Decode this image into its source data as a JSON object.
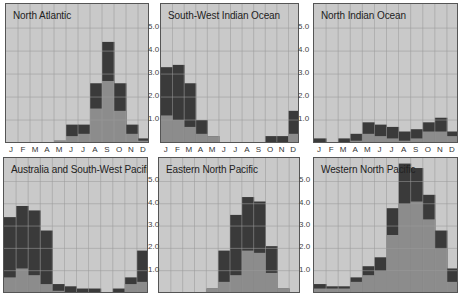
{
  "colors": {
    "background": "#c9c9c9",
    "grid": "#9c9c9c",
    "total": "#3a3a3a",
    "severe": "#8c8c8c",
    "border": "#555555"
  },
  "chart_data": [
    {
      "type": "bar",
      "title": "North Atlantic",
      "categories": [
        "J",
        "F",
        "M",
        "A",
        "M",
        "J",
        "J",
        "A",
        "S",
        "O",
        "N",
        "D"
      ],
      "series": [
        {
          "name": "total (dark)",
          "values": [
            0,
            0,
            0,
            0,
            0.1,
            0.8,
            0.8,
            2.6,
            4.4,
            2.6,
            0.8,
            0.2
          ]
        },
        {
          "name": "lower (mid-gray)",
          "values": [
            0,
            0,
            0,
            0,
            0.1,
            0.3,
            0.4,
            1.5,
            2.7,
            1.4,
            0.4,
            0.1
          ]
        }
      ],
      "yticks": [
        "1.0",
        "2.0",
        "3.0",
        "4.0",
        "5.0"
      ],
      "ylim": [
        0,
        6
      ],
      "grid": true
    },
    {
      "type": "bar",
      "title": "South-West Indian Ocean",
      "categories": [
        "J",
        "F",
        "M",
        "A",
        "M",
        "J",
        "J",
        "A",
        "S",
        "O",
        "N",
        "D"
      ],
      "series": [
        {
          "name": "total (dark)",
          "values": [
            3.3,
            3.4,
            2.6,
            1.0,
            0.3,
            0,
            0,
            0,
            0,
            0.3,
            0.3,
            1.4
          ]
        },
        {
          "name": "lower (mid-gray)",
          "values": [
            1.2,
            1.0,
            0.7,
            0.4,
            0.3,
            0,
            0,
            0,
            0,
            0,
            0,
            0.4
          ]
        }
      ],
      "yticks": [
        "1.0",
        "2.0",
        "3.0",
        "4.0",
        "5.0"
      ],
      "ylim": [
        0,
        6
      ],
      "grid": true
    },
    {
      "type": "bar",
      "title": "North Indian Ocean",
      "categories": [
        "J",
        "F",
        "M",
        "A",
        "M",
        "J",
        "J",
        "A",
        "S",
        "O",
        "N",
        "D"
      ],
      "series": [
        {
          "name": "total (dark)",
          "values": [
            0.2,
            0,
            0.2,
            0.4,
            0.9,
            0.8,
            0.7,
            0.5,
            0.6,
            0.9,
            1.1,
            0.5
          ]
        },
        {
          "name": "lower (mid-gray)",
          "values": [
            0,
            0,
            0,
            0.1,
            0.4,
            0.3,
            0.2,
            0.1,
            0.2,
            0.5,
            0.5,
            0.3
          ]
        }
      ],
      "yticks": [
        "1.0",
        "2.0",
        "3.0",
        "4.0",
        "5.0"
      ],
      "ylim": [
        0,
        6
      ],
      "grid": true
    },
    {
      "type": "bar",
      "title": "Australia and South-West Pacific",
      "categories": [
        "J",
        "F",
        "M",
        "A",
        "M",
        "J",
        "J",
        "A",
        "S",
        "O",
        "N",
        "D"
      ],
      "series": [
        {
          "name": "total (dark)",
          "values": [
            3.4,
            3.9,
            3.7,
            2.8,
            0.4,
            0.3,
            0.2,
            0.2,
            0,
            0.2,
            0.7,
            1.9
          ]
        },
        {
          "name": "lower (mid-gray)",
          "values": [
            0.7,
            1.1,
            0.8,
            0.4,
            0.1,
            0,
            0,
            0,
            0,
            0,
            0.4,
            0.5
          ]
        }
      ],
      "yticks": [
        "1.0",
        "2.0",
        "3.0",
        "4.0",
        "5.0"
      ],
      "ylim": [
        0,
        6
      ],
      "grid": true
    },
    {
      "type": "bar",
      "title": "Eastern North Pacific",
      "categories": [
        "J",
        "F",
        "M",
        "A",
        "M",
        "J",
        "J",
        "A",
        "S",
        "O",
        "N",
        "D"
      ],
      "series": [
        {
          "name": "total (dark)",
          "values": [
            0,
            0,
            0,
            0,
            0.2,
            1.9,
            3.5,
            4.3,
            4.1,
            2.1,
            0.2,
            0
          ]
        },
        {
          "name": "lower (mid-gray)",
          "values": [
            0,
            0,
            0,
            0,
            0.2,
            0.5,
            0.8,
            1.9,
            1.8,
            0.9,
            0.2,
            0
          ]
        }
      ],
      "yticks": [
        "1.0",
        "2.0",
        "3.0",
        "4.0",
        "5.0"
      ],
      "ylim": [
        0,
        6
      ],
      "grid": true
    },
    {
      "type": "bar",
      "title": "Western North Pacific",
      "categories": [
        "J",
        "F",
        "M",
        "A",
        "M",
        "J",
        "J",
        "A",
        "S",
        "O",
        "N",
        "D"
      ],
      "series": [
        {
          "name": "total (dark)",
          "values": [
            0.4,
            0.3,
            0.3,
            0.7,
            1.2,
            1.6,
            3.8,
            5.8,
            5.6,
            4.4,
            2.8,
            1.1
          ]
        },
        {
          "name": "lower (mid-gray)",
          "values": [
            0.2,
            0.2,
            0.2,
            0.5,
            0.8,
            1.0,
            2.6,
            4.0,
            4.1,
            3.3,
            2.0,
            0.5
          ]
        }
      ],
      "yticks": [
        "1.0",
        "2.0",
        "3.0",
        "4.0",
        "5.0"
      ],
      "ylim": [
        0,
        6
      ],
      "grid": true
    }
  ],
  "month_labels": [
    "J",
    "F",
    "M",
    "A",
    "M",
    "J",
    "J",
    "A",
    "S",
    "O",
    "N",
    "D"
  ]
}
